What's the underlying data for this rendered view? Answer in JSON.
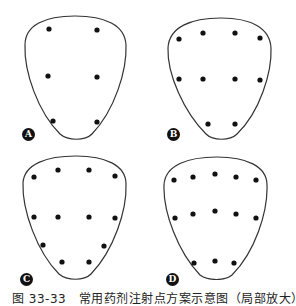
{
  "figure": {
    "caption": "图 33-33　常用药剂注射点方案示意图（局部放大）",
    "stroke_color": "#333333",
    "dot_color": "#111111"
  },
  "panels": [
    {
      "label": "A",
      "offset": [
        0,
        0
      ],
      "dots": [
        [
          49,
          29
        ],
        [
          97,
          30
        ],
        [
          48,
          76
        ],
        [
          97,
          77
        ],
        [
          53,
          121
        ],
        [
          97,
          122
        ]
      ]
    },
    {
      "label": "B",
      "offset": [
        141,
        0
      ],
      "dots": [
        [
          38,
          39
        ],
        [
          62,
          33
        ],
        [
          94,
          33
        ],
        [
          119,
          38
        ],
        [
          38,
          79
        ],
        [
          62,
          79
        ],
        [
          94,
          79
        ],
        [
          119,
          80
        ],
        [
          67,
          124
        ],
        [
          94,
          124
        ]
      ]
    },
    {
      "label": "C",
      "offset": [
        0,
        140
      ],
      "dots": [
        [
          34,
          37
        ],
        [
          58,
          30
        ],
        [
          89,
          30
        ],
        [
          115,
          36
        ],
        [
          34,
          77
        ],
        [
          58,
          77
        ],
        [
          89,
          77
        ],
        [
          115,
          78
        ],
        [
          43,
          105
        ],
        [
          104,
          106
        ],
        [
          62,
          122
        ],
        [
          89,
          122
        ]
      ]
    },
    {
      "label": "D",
      "offset": [
        141,
        140
      ],
      "dots": [
        [
          33,
          40
        ],
        [
          52,
          37
        ],
        [
          74,
          34
        ],
        [
          95,
          37
        ],
        [
          115,
          40
        ],
        [
          34,
          78
        ],
        [
          52,
          74
        ],
        [
          74,
          71
        ],
        [
          95,
          74
        ],
        [
          115,
          78
        ],
        [
          53,
          123
        ],
        [
          74,
          121
        ],
        [
          93,
          123
        ]
      ]
    }
  ]
}
